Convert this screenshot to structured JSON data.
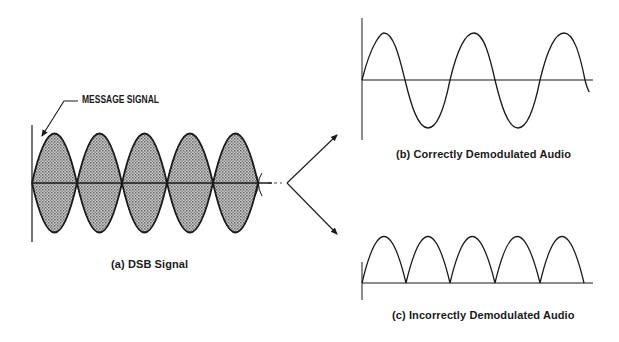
{
  "figure": {
    "panels": [
      {
        "id": "a",
        "caption": "(a) DSB Signal",
        "annotation": "MESSAGE SIGNAL",
        "description": "Double-sideband signal with shaded envelope, 5 lobes"
      },
      {
        "id": "b",
        "caption": "(b) Correctly Demodulated Audio",
        "description": "Sine wave, 2.5 cycles"
      },
      {
        "id": "c",
        "caption": "(c) Incorrectly Demodulated Audio",
        "description": "Full-wave rectified sine, 5 arches"
      }
    ],
    "colors": {
      "line": "#1a1a1a",
      "fill": "#a8a8a8",
      "background": "#ffffff"
    }
  }
}
